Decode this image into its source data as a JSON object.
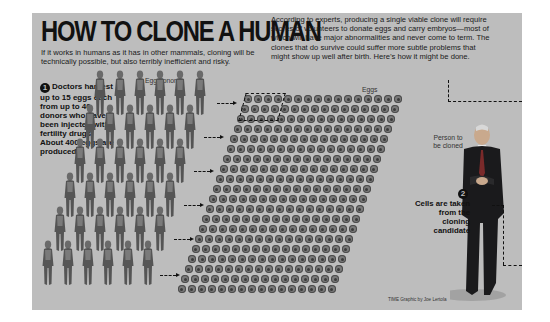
{
  "title": "HOW TO CLONE A HUMAN",
  "subtitle": "If it works in humans as it has in other mammals, cloning will be technically possible, but also terribly inefficient and risky.",
  "intro": "According to experts, producing a single viable clone will require scores of volunteers to donate eggs and carry embryos—most of which will have major abnormalities and never come to term. The clones that do survive could suffer more subtle problems that might show up well after birth. Here’s how it might be done.",
  "steps": [
    {
      "number": "1",
      "text": "Doctors harvest up to 15 eggs each from up to 40 donors who have been injected with fertility drugs. About 400 eggs are produced."
    },
    {
      "number": "2",
      "text": "Cells are taken from the cloning candidate"
    }
  ],
  "labels": {
    "egg_donors": "Egg donors",
    "eggs": "Eggs",
    "person_to_be_cloned": "Person to be cloned"
  },
  "credit": "TIME Graphic by Joe Lertola",
  "colors": {
    "panel_bg": "#bdbdbd",
    "text": "#111111",
    "figure": "#5a5a5a",
    "egg": "#7a7a7a"
  },
  "counts": {
    "donors_max": 40,
    "eggs_per_donor_max": 15,
    "eggs_total": 400
  },
  "icons": {
    "donor_figure": "person-figure-icon",
    "egg": "egg-cell-icon",
    "arrow": "dashed-arrow-icon",
    "step_badge": "numbered-circle-icon"
  }
}
